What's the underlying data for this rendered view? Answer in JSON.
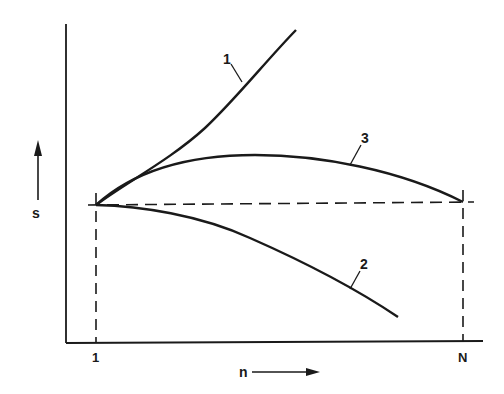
{
  "diagram": {
    "type": "line",
    "axes": {
      "y_label": "s",
      "x_label": "n",
      "x_ticks": [
        "1",
        "N"
      ],
      "colors": {
        "ink": "#1a1a1a",
        "background": "#ffffff"
      }
    },
    "reference_lines": {
      "horizontal_dashed": "s at n = 1 (constant level)",
      "vertical_dashed": [
        "n = 1",
        "n = N"
      ]
    },
    "curves": [
      {
        "id": "1",
        "label": "1",
        "description": "rises steeply and monotonically from n = 1"
      },
      {
        "id": "2",
        "label": "2",
        "description": "stays near initial level then decreases"
      },
      {
        "id": "3",
        "label": "3",
        "description": "rises to a maximum then returns to initial level at n = N"
      }
    ]
  }
}
